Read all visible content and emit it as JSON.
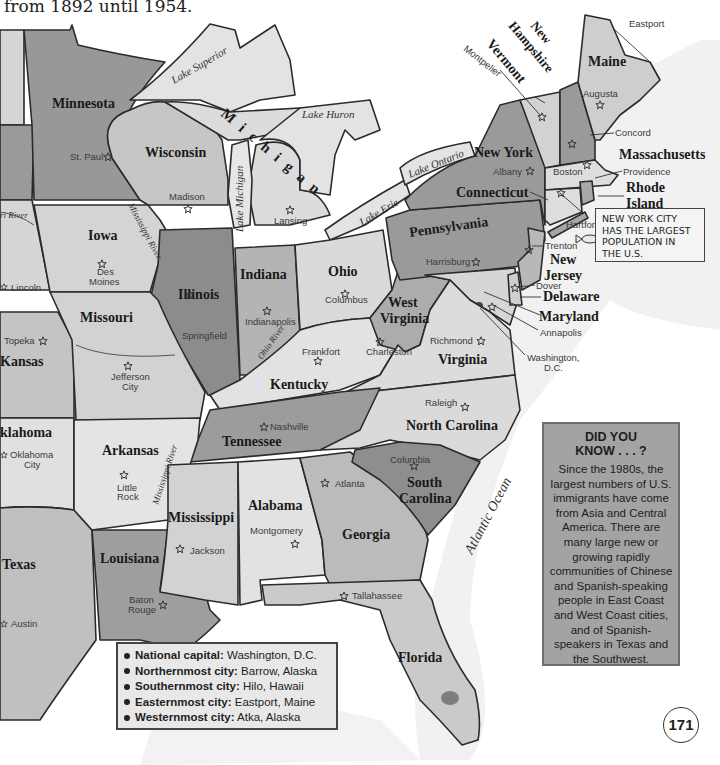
{
  "intro_text": "from 1892 until 1954.",
  "colors": {
    "dark_state": "#8e8e8e",
    "mid_state": "#b2b2b2",
    "light_state": "#d2d2d2",
    "lake": "#e0e0e0",
    "ocean_shade": "#ececec",
    "border": "#2b2b2b",
    "did_you_know_bg": "#a3a3a3"
  },
  "states": [
    {
      "name": "Minnesota"
    },
    {
      "name": "Wisconsin"
    },
    {
      "name": "Michigan"
    },
    {
      "name": "Iowa"
    },
    {
      "name": "Illinois"
    },
    {
      "name": "Indiana"
    },
    {
      "name": "Ohio"
    },
    {
      "name": "Missouri"
    },
    {
      "name": "Kansas"
    },
    {
      "name": "klahoma"
    },
    {
      "name": "Texas"
    },
    {
      "name": "Arkansas"
    },
    {
      "name": "Louisiana"
    },
    {
      "name": "Mississippi"
    },
    {
      "name": "Alabama"
    },
    {
      "name": "Georgia"
    },
    {
      "name": "Florida"
    },
    {
      "name": "Tennessee"
    },
    {
      "name": "Kentucky"
    },
    {
      "name": "West Virginia"
    },
    {
      "name": "Virginia"
    },
    {
      "name": "North Carolina"
    },
    {
      "name": "South Carolina"
    },
    {
      "name": "Pennsylvania"
    },
    {
      "name": "New York"
    },
    {
      "name": "New Jersey"
    },
    {
      "name": "Delaware"
    },
    {
      "name": "Maryland"
    },
    {
      "name": "Connecticut"
    },
    {
      "name": "Rhode Island"
    },
    {
      "name": "Massachusetts"
    },
    {
      "name": "Vermont"
    },
    {
      "name": "New Hampshire"
    },
    {
      "name": "Maine"
    }
  ],
  "state_labels": {
    "minnesota": "Minnesota",
    "wisconsin": "Wisconsin",
    "michigan": "Michigan",
    "iowa": "Iowa",
    "illinois": "Illinois",
    "indiana": "Indiana",
    "ohio": "Ohio",
    "missouri": "Missouri",
    "kansas": "Kansas",
    "oklahoma": "klahoma",
    "texas": "Texas",
    "arkansas": "Arkansas",
    "louisiana": "Louisiana",
    "mississippi": "Mississippi",
    "alabama": "Alabama",
    "georgia": "Georgia",
    "florida": "Florida",
    "tennessee": "Tennessee",
    "kentucky": "Kentucky",
    "west_virginia_1": "West",
    "west_virginia_2": "Virginia",
    "virginia": "Virginia",
    "north_carolina": "North Carolina",
    "south_carolina_1": "South",
    "south_carolina_2": "Carolina",
    "pennsylvania": "Pennsylvania",
    "new_york": "New York",
    "new_jersey_1": "New",
    "new_jersey_2": "Jersey",
    "delaware": "Delaware",
    "maryland": "Maryland",
    "connecticut": "Connecticut",
    "rhode_island_1": "Rhode",
    "rhode_island_2": "Island",
    "massachusetts": "Massachusetts",
    "vermont": "Vermont",
    "new_hampshire_1": "New",
    "new_hampshire_2": "Hampshire",
    "maine": "Maine"
  },
  "capitals": {
    "st_paul": "St. Paul",
    "madison": "Madison",
    "lansing": "Lansing",
    "des_moines_1": "Des",
    "des_moines_2": "Moines",
    "lincoln": "Lincoln",
    "springfield": "Springfield",
    "indianapolis": "Indianapolis",
    "columbus": "Columbus",
    "topeka": "Topeka",
    "jefferson_city_1": "Jefferson",
    "jefferson_city_2": "City",
    "frankfort": "Frankfort",
    "charleston": "Charleston",
    "richmond": "Richmond",
    "harrisburg": "Harrisburg",
    "albany": "Albany",
    "trenton": "Trenton",
    "dover": "Dover",
    "annapolis": "Annapolis",
    "washington_1": "Washington,",
    "washington_2": "D.C.",
    "hartford": "Hartford",
    "providence": "Providence",
    "boston": "Boston",
    "concord": "Concord",
    "augusta": "Augusta",
    "montpelier": "Montpelier",
    "eastport": "Eastport",
    "oklahoma_city_1": "Oklahoma",
    "oklahoma_city_2": "City",
    "little_rock_1": "Little",
    "little_rock_2": "Rock",
    "nashville": "Nashville",
    "raleigh": "Raleigh",
    "columbia": "Columbia",
    "atlanta": "Atlanta",
    "montgomery": "Montgomery",
    "jackson": "Jackson",
    "baton_rouge_1": "Baton",
    "baton_rouge_2": "Rouge",
    "tallahassee": "Tallahassee",
    "austin": "Austin"
  },
  "water_labels": {
    "lake_superior": "Lake Superior",
    "lake_huron": "Lake Huron",
    "lake_michigan": "Lake Michigan",
    "lake_erie": "Lake Erie",
    "lake_ontario": "Lake Ontario",
    "mississippi_river_1": "Mississippi River",
    "mississippi_river_2": "Mississippi River",
    "ohio_river": "Ohio River",
    "missouri_river": "ri River",
    "atlantic_ocean": "Atlantic Ocean"
  },
  "nyc_note": {
    "line1": "NEW YORK CITY",
    "line2": "HAS THE LARGEST",
    "line3": "POPULATION IN",
    "line4": "THE U.S."
  },
  "did_you_know": {
    "title_1": "DID YOU",
    "title_2": "KNOW . . . ?",
    "body": "Since the 1980s, the largest numbers of U.S. immigrants have come from Asia and Central America. There are many large new or growing rapidly communities of Chinese and Spanish-speaking people in East Coast and West Coast cities, and of Spanish-speakers in Texas and the Southwest."
  },
  "facts": [
    {
      "label": "National capital:",
      "value": "Washington, D.C."
    },
    {
      "label": "Northernmost city:",
      "value": "Barrow, Alaska"
    },
    {
      "label": "Southernmost city:",
      "value": "Hilo, Hawaii"
    },
    {
      "label": "Easternmost city:",
      "value": "Eastport, Maine"
    },
    {
      "label": "Westernmost city:",
      "value": "Atka, Alaska"
    }
  ],
  "page_number": "171"
}
